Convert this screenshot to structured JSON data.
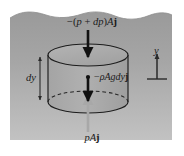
{
  "figure": {
    "background_color": "#ffffff",
    "fluid_region": {
      "name": "fluid-body",
      "fill_top_color": "#9d9d9d",
      "fill_bottom_color": "#bdbdbd",
      "surface_style": "wavy-free-surface"
    },
    "labels": {
      "top_force": "−(p + dp)Aj",
      "top_force_parts": {
        "minus": "−(",
        "p": "p",
        "plus": " + ",
        "dp": "dp",
        "close_a": ")",
        "area": "A",
        "unit_vector": "j"
      },
      "weight_force": "−ρAgdyj",
      "weight_force_parts": {
        "minus": "−",
        "rho": "ρ",
        "area": "A",
        "gravity": "g",
        "dy": "dy",
        "unit_vector": "j"
      },
      "bottom_force": "pAj",
      "bottom_force_parts": {
        "p": "p",
        "area": "A",
        "unit_vector": "j"
      },
      "thickness": "dy",
      "axis": "y"
    },
    "arrows": {
      "top_force_arrow": {
        "name": "downward-pressure-arrow-top",
        "direction": "down",
        "color": "#111111"
      },
      "weight_arrow": {
        "name": "downward-weight-arrow",
        "direction": "down",
        "color": "#111111"
      },
      "bottom_force_arrow": {
        "name": "upward-pressure-arrow-bottom",
        "direction": "up",
        "color": "#a8a8a8"
      },
      "dimension_arrow": {
        "name": "dy-dimension-arrow",
        "direction": "both",
        "color": "#2a2a2a"
      },
      "axis_arrow": {
        "name": "y-axis-arrow",
        "direction": "up",
        "color": "#2a2a2a"
      }
    },
    "cylinder": {
      "name": "fluid-cylinder-element",
      "outline_color": "#1c1c1c",
      "top_face": "solid-ellipse",
      "bottom_face": "dashed-back-solid-front"
    }
  }
}
